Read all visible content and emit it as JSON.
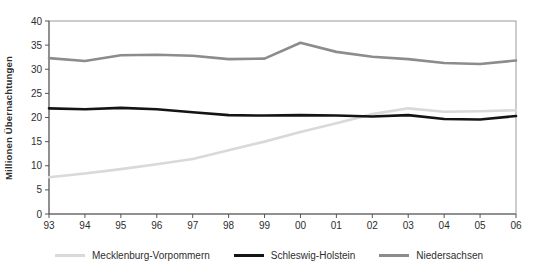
{
  "chart_data": {
    "type": "line",
    "title": "",
    "xlabel": "",
    "ylabel": "Millionen Übernachtungen",
    "ylim": [
      0,
      40
    ],
    "y_ticks": [
      0,
      5,
      10,
      15,
      20,
      25,
      30,
      35,
      40
    ],
    "grid": false,
    "legend_position": "bottom",
    "categories": [
      "93",
      "94",
      "95",
      "96",
      "97",
      "98",
      "99",
      "00",
      "01",
      "02",
      "03",
      "04",
      "05",
      "06"
    ],
    "series": [
      {
        "name": "Mecklenburg-Vorpommern",
        "color": "#d9d9d9",
        "values": [
          7.6,
          8.4,
          9.3,
          10.3,
          11.4,
          13.2,
          15.0,
          17.0,
          18.8,
          20.7,
          21.9,
          21.2,
          21.3,
          21.5
        ]
      },
      {
        "name": "Schleswig-Holstein",
        "color": "#141414",
        "values": [
          21.9,
          21.7,
          22.0,
          21.7,
          21.1,
          20.5,
          20.4,
          20.5,
          20.4,
          20.2,
          20.5,
          19.7,
          19.6,
          20.3
        ]
      },
      {
        "name": "Niedersachsen",
        "color": "#8c8c8c",
        "values": [
          32.3,
          31.7,
          32.9,
          33.0,
          32.8,
          32.1,
          32.2,
          35.5,
          33.6,
          32.6,
          32.1,
          31.3,
          31.1,
          31.8
        ]
      }
    ],
    "axis_color": "#555555",
    "border_color": "#9a9a9a"
  }
}
